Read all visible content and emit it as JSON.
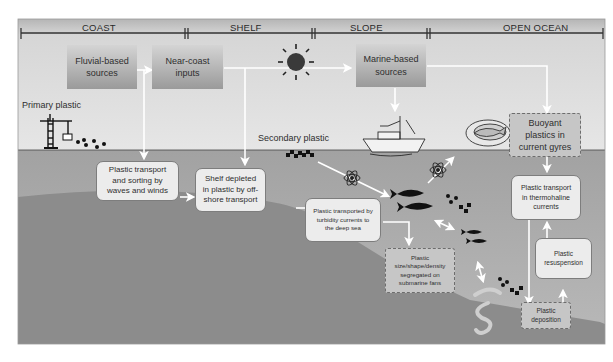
{
  "figure": {
    "colors": {
      "background": "#ffffff",
      "sky": "#e2e2e2",
      "header_band": "#b9b9b9",
      "water": "#a9a9a9",
      "seabed": "#8a8a8a",
      "shelf_seabed": "#9a9a9a",
      "arrow": "#ffffff",
      "timeline": "#333333",
      "icon": "#111111"
    }
  },
  "zones": [
    {
      "label": "COAST"
    },
    {
      "label": "SHELF"
    },
    {
      "label": "SLOPE"
    },
    {
      "label": "OPEN OCEAN"
    }
  ],
  "sources": {
    "fluvial": {
      "line1": "Fluvial-based",
      "line2": "sources"
    },
    "near_coast": {
      "line1": "Near-coast",
      "line2": "inputs"
    },
    "marine": {
      "line1": "Marine-based",
      "line2": "sources"
    }
  },
  "labels": {
    "primary_plastic": "Primary plastic",
    "secondary_plastic": "Secondary plastic"
  },
  "processes": {
    "waves": {
      "line1": "Plastic transport",
      "line2": "and sorting by",
      "line3": "waves and winds"
    },
    "shelf_depleted": {
      "line1": "Shelf depleted",
      "line2": "in plastic by off-",
      "line3": "shore transport"
    },
    "turbidity": {
      "line1": "Plastic transported by",
      "line2": "turbidity currents to",
      "line3": "the deep sea"
    },
    "fans": {
      "line1": "Plastic",
      "line2": "size/shape/density",
      "line3": "segregated on",
      "line4": "submarine fans"
    },
    "buoyant": {
      "line1": "Buoyant",
      "line2": "plastics in",
      "line3": "current gyres"
    },
    "thermohaline": {
      "line1": "Plastic transport",
      "line2": "in thermohaline",
      "line3": "currents"
    },
    "resuspension": {
      "line1": "Plastic",
      "line2": "resuspension"
    },
    "deposition": {
      "line1": "Plastic",
      "line2": "deposition"
    }
  },
  "icons": [
    "crane-icon",
    "plastic-pellets-icon",
    "sun-icon",
    "fishing-boat-icon",
    "fish-plate-icon",
    "fragments-icon",
    "atom-icon",
    "fish-icon",
    "worm-icon"
  ]
}
